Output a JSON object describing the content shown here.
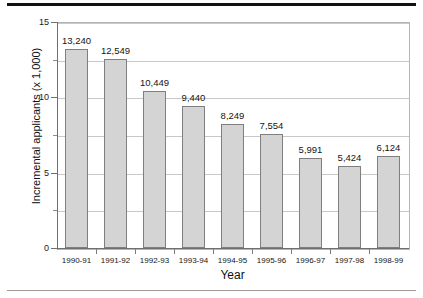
{
  "figure": {
    "rule_top_color": "#111111",
    "rule_bottom_color": "#9a9a9a"
  },
  "chart_data": {
    "type": "bar",
    "title": "",
    "xlabel": "Year",
    "ylabel": "Incremental applicants (x 1,000)",
    "categories": [
      "1990-91",
      "1991-92",
      "1992-93",
      "1993-94",
      "1994-95",
      "1995-96",
      "1996-97",
      "1997-98",
      "1998-99"
    ],
    "values": [
      13240,
      12549,
      10449,
      9440,
      8249,
      7554,
      5991,
      5424,
      6124
    ],
    "value_labels": [
      "13,240",
      "12,549",
      "10,449",
      "9,440",
      "8,249",
      "7,554",
      "5,991",
      "5,424",
      "6,124"
    ],
    "value_scale": 1000,
    "ylim": [
      0,
      15
    ],
    "ytick_major": [
      0,
      5,
      10,
      15
    ],
    "ytick_major_labels": [
      "0",
      "5",
      "10",
      "15"
    ],
    "ytick_minor": [
      2.5,
      7.5,
      12.5
    ],
    "grid": "horizontal-major-and-minor",
    "legend": "none",
    "bar_fill": "#d4d4d4",
    "bar_edge": "#7f7f7f"
  }
}
